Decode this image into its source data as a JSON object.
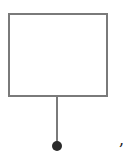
{
  "diagram": {
    "shapes": [
      {
        "type": "rectangle",
        "label": ""
      },
      {
        "type": "line",
        "label": ""
      },
      {
        "type": "terminal-dot",
        "label": ""
      }
    ],
    "trailing_text": ",",
    "colors": {
      "stroke": "#7a7a7a",
      "dot": "#2a2a2a"
    }
  }
}
